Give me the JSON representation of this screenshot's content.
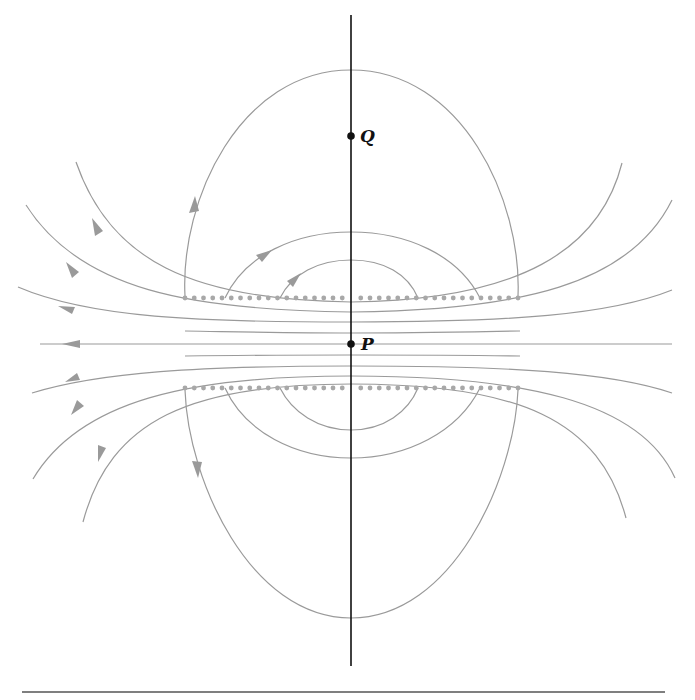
{
  "diagram": {
    "type": "field-line diagram",
    "colors": {
      "field_line": "#9a9a9a",
      "axis": "#111111",
      "dots": "#a8a8a8",
      "points": "#111111",
      "rule": "#555555"
    },
    "points": [
      {
        "id": "Q",
        "label": "Q",
        "x": 351,
        "y": 136
      },
      {
        "id": "P",
        "label": "P",
        "x": 351,
        "y": 344
      }
    ],
    "axis": {
      "x": 351,
      "y_top": 15,
      "y_bottom": 666
    },
    "dot_rows": [
      {
        "y": 298,
        "x_start": 185,
        "x_end": 518,
        "count": 37
      },
      {
        "y": 388,
        "x_start": 185,
        "x_end": 518,
        "count": 37
      }
    ],
    "bottom_rule": {
      "y": 692,
      "x_start": 22,
      "x_end": 665
    }
  }
}
